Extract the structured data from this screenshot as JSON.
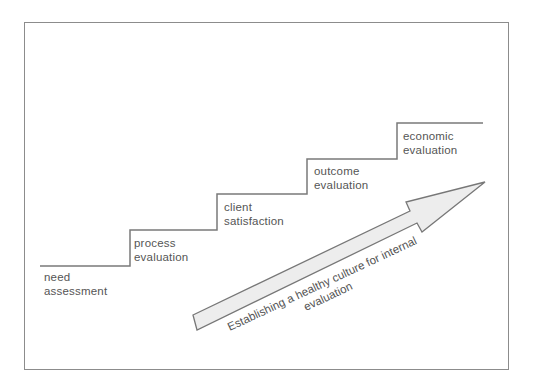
{
  "diagram": {
    "colors": {
      "frame": "#8c8c8c",
      "stairs": "#7a7a7a",
      "arrow_fill": "#ededed",
      "arrow_stroke": "#777777",
      "text": "#555555"
    },
    "steps": [
      {
        "line1": "need",
        "line2": "assessment"
      },
      {
        "line1": "process",
        "line2": "evaluation"
      },
      {
        "line1": "client",
        "line2": "satisfaction"
      },
      {
        "line1": "outcome",
        "line2": "evaluation"
      },
      {
        "line1": "economic",
        "line2": "evaluation"
      }
    ],
    "arrow": {
      "line1": "Establishing a healthy culture for internal",
      "line2": "evaluation"
    }
  }
}
